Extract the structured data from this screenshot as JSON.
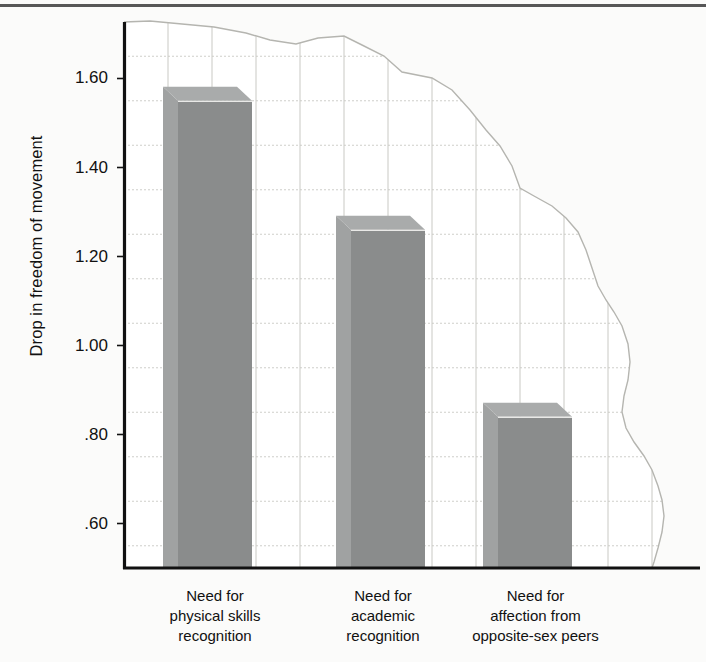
{
  "chart_data": {
    "type": "bar",
    "title": "",
    "xlabel": "",
    "ylabel": "Drop in freedom of movement",
    "categories": [
      "Need for physical skills recognition",
      "Need for academic recognition",
      "Need for affection from opposite-sex peers"
    ],
    "category_lines": [
      [
        "Need for",
        "physical skills",
        "recognition"
      ],
      [
        "Need for",
        "academic",
        "recognition"
      ],
      [
        "Need for",
        "affection from",
        "opposite-sex peers"
      ]
    ],
    "values": [
      1.55,
      1.26,
      0.84
    ],
    "ylim": [
      0.5,
      1.72
    ],
    "ytick_labels": [
      "1.60",
      "1.40",
      "1.20",
      "1.00",
      ".80",
      ".60"
    ],
    "ytick_values": [
      1.6,
      1.4,
      1.2,
      1.0,
      0.8,
      0.6
    ],
    "minor_gridlines": true,
    "grid": true,
    "legend": "none",
    "bar_style": "3d-extruded",
    "colors": {
      "bar_front": "#8a8c8c",
      "bar_top": "#a9abab",
      "bar_side": "#a0a2a2",
      "grid": "#c9c9c4",
      "axis": "#111111",
      "background": "#fbfbfa",
      "border": "#b8b8b2",
      "text": "#111111"
    }
  },
  "axes": {
    "y_axis_title": "Drop in freedom of movement"
  },
  "page": {
    "top_rule": ""
  }
}
